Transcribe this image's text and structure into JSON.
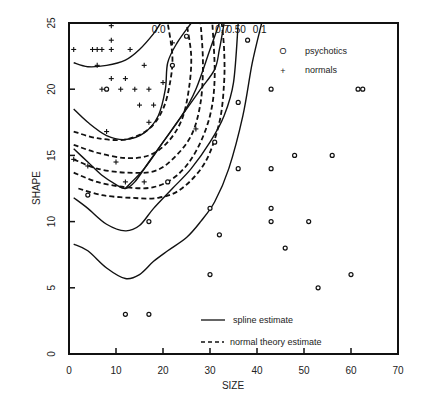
{
  "chart_data": {
    "type": "scatter",
    "title": "",
    "xlabel": "SIZE",
    "ylabel": "SHAPE",
    "xlim": [
      0,
      70
    ],
    "ylim": [
      0,
      25
    ],
    "xticks": [
      0,
      10,
      20,
      30,
      40,
      50,
      60,
      70
    ],
    "yticks": [
      0,
      5,
      10,
      15,
      20,
      25
    ],
    "grid": false,
    "legend": {
      "placement": "top-right",
      "entries": [
        {
          "marker": "O",
          "label": "psychotics"
        },
        {
          "marker": "+",
          "label": "normals"
        }
      ]
    },
    "line_legend": {
      "placement": "bottom-center",
      "entries": [
        {
          "style": "solid",
          "label": "spline estimate"
        },
        {
          "style": "dashed",
          "label": "normal theory estimate"
        }
      ]
    },
    "series": [
      {
        "name": "psychotics",
        "marker": "circle",
        "points": [
          [
            38,
            23.7
          ],
          [
            43,
            20
          ],
          [
            61.5,
            20
          ],
          [
            62.5,
            20
          ],
          [
            36,
            19
          ],
          [
            48,
            15
          ],
          [
            56,
            15
          ],
          [
            36,
            14
          ],
          [
            43,
            14
          ],
          [
            43,
            11
          ],
          [
            43,
            10
          ],
          [
            51,
            10
          ],
          [
            30,
            11
          ],
          [
            32,
            9
          ],
          [
            46,
            8
          ],
          [
            30,
            6
          ],
          [
            60,
            6
          ],
          [
            53,
            5
          ],
          [
            12,
            3
          ],
          [
            17,
            3
          ],
          [
            17,
            10
          ],
          [
            4,
            12
          ],
          [
            8,
            20
          ],
          [
            22,
            21.8
          ],
          [
            25,
            24
          ],
          [
            21,
            13
          ],
          [
            31,
            16
          ]
        ]
      },
      {
        "name": "normals",
        "marker": "plus",
        "points": [
          [
            9,
            24.8
          ],
          [
            9,
            23.7
          ],
          [
            1,
            23
          ],
          [
            5,
            23
          ],
          [
            6,
            23
          ],
          [
            7,
            23
          ],
          [
            9,
            23
          ],
          [
            13,
            23
          ],
          [
            6,
            21.8
          ],
          [
            16,
            21.8
          ],
          [
            9,
            20.8
          ],
          [
            12,
            20.8
          ],
          [
            7,
            20
          ],
          [
            11,
            20
          ],
          [
            14,
            20
          ],
          [
            17,
            20
          ],
          [
            15,
            18.8
          ],
          [
            18,
            18.8
          ],
          [
            17,
            17.5
          ],
          [
            8,
            16.8
          ],
          [
            1,
            14.7
          ],
          [
            4,
            14.2
          ],
          [
            10,
            14.5
          ],
          [
            12,
            13
          ],
          [
            16,
            13
          ],
          [
            22,
            23.5
          ],
          [
            20,
            20.5
          ],
          [
            27,
            17
          ]
        ]
      }
    ],
    "contours": [
      {
        "method": "spline",
        "level": "0.0",
        "label": "0.0",
        "points": [
          [
            1,
            22
          ],
          [
            4,
            21.7
          ],
          [
            8,
            21.8
          ],
          [
            12,
            22.2
          ],
          [
            15,
            23
          ],
          [
            18,
            24.2
          ],
          [
            19.5,
            25
          ]
        ]
      },
      {
        "method": "spline",
        "level": "inner",
        "label": "",
        "points": [
          [
            1,
            18.5
          ],
          [
            4,
            17.5
          ],
          [
            8,
            16.5
          ],
          [
            12,
            16.2
          ],
          [
            16,
            16.7
          ],
          [
            19,
            18
          ],
          [
            20.5,
            20
          ],
          [
            21,
            22
          ],
          [
            23,
            23.5
          ],
          [
            26,
            25
          ]
        ]
      },
      {
        "method": "spline",
        "level": "0.7",
        "label": "0.7",
        "points": [
          [
            1,
            15.5
          ],
          [
            4,
            14.5
          ],
          [
            7,
            13.5
          ],
          [
            10,
            12.8
          ],
          [
            12,
            12.5
          ],
          [
            14,
            13
          ],
          [
            17,
            14.5
          ],
          [
            21,
            16.5
          ],
          [
            25,
            18.5
          ],
          [
            28,
            20
          ],
          [
            31,
            21.5
          ],
          [
            32,
            23
          ],
          [
            33,
            25
          ]
        ]
      },
      {
        "method": "spline",
        "level": "0.50",
        "label": "0.50",
        "points": [
          [
            1,
            11.8
          ],
          [
            4,
            11
          ],
          [
            8,
            9.8
          ],
          [
            12,
            9.3
          ],
          [
            15,
            9.7
          ],
          [
            18,
            11
          ],
          [
            22,
            12.5
          ],
          [
            26,
            14
          ],
          [
            30,
            16
          ],
          [
            33,
            18
          ],
          [
            35,
            20.5
          ],
          [
            36,
            25
          ]
        ]
      },
      {
        "method": "spline",
        "level": "0.1",
        "label": "0.1",
        "points": [
          [
            1,
            8.3
          ],
          [
            4,
            7.8
          ],
          [
            8,
            6.5
          ],
          [
            12,
            5.7
          ],
          [
            15,
            6
          ],
          [
            18,
            7
          ],
          [
            21,
            7.8
          ],
          [
            25,
            8.8
          ],
          [
            28,
            10
          ],
          [
            31,
            11.5
          ],
          [
            34,
            14
          ],
          [
            37,
            18
          ],
          [
            39,
            22
          ],
          [
            41,
            25
          ]
        ]
      },
      {
        "method": "spline",
        "level": "cross",
        "label": "",
        "points": [
          [
            12,
            12.5
          ],
          [
            16,
            14
          ],
          [
            20,
            16
          ],
          [
            24,
            18
          ],
          [
            27,
            20
          ],
          [
            30,
            23
          ],
          [
            32,
            25
          ]
        ]
      },
      {
        "method": "normal",
        "level": "1",
        "label": "",
        "points": [
          [
            1,
            16.8
          ],
          [
            6,
            16.3
          ],
          [
            12,
            16.2
          ],
          [
            17,
            17
          ],
          [
            20,
            18.5
          ],
          [
            21.5,
            20.5
          ],
          [
            22,
            22.5
          ],
          [
            21,
            25
          ]
        ]
      },
      {
        "method": "normal",
        "level": "2",
        "label": "",
        "points": [
          [
            1,
            15.8
          ],
          [
            6,
            15.2
          ],
          [
            12,
            14.8
          ],
          [
            17,
            15
          ],
          [
            21,
            16
          ],
          [
            24,
            17.7
          ],
          [
            25.5,
            20
          ],
          [
            26,
            22.5
          ],
          [
            25,
            25
          ]
        ]
      },
      {
        "method": "normal",
        "level": "3",
        "label": "",
        "points": [
          [
            1,
            14.7
          ],
          [
            6,
            14
          ],
          [
            12,
            13.7
          ],
          [
            18,
            13.8
          ],
          [
            22,
            14.7
          ],
          [
            26,
            16.5
          ],
          [
            28,
            19
          ],
          [
            28.5,
            22
          ],
          [
            28,
            25
          ]
        ]
      },
      {
        "method": "normal",
        "level": "4",
        "label": "",
        "points": [
          [
            1,
            13.7
          ],
          [
            6,
            13
          ],
          [
            12,
            12.6
          ],
          [
            18,
            12.6
          ],
          [
            23,
            13.5
          ],
          [
            27,
            15.3
          ],
          [
            30,
            18
          ],
          [
            31,
            21
          ],
          [
            30.5,
            25
          ]
        ]
      },
      {
        "method": "normal",
        "level": "5",
        "label": "",
        "points": [
          [
            2,
            12.5
          ],
          [
            7,
            12
          ],
          [
            13,
            11.8
          ],
          [
            19,
            11.8
          ],
          [
            24,
            12.5
          ],
          [
            29,
            14.5
          ],
          [
            32,
            17.5
          ],
          [
            33,
            20.5
          ],
          [
            33,
            23
          ],
          [
            32.5,
            25
          ]
        ]
      }
    ]
  }
}
